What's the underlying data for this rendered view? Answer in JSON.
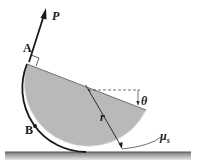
{
  "diagram": {
    "type": "mechanics-free-body",
    "labels": {
      "force": "P",
      "point_a": "A",
      "point_b": "B",
      "radius": "r",
      "angle": "θ",
      "friction": "μ",
      "friction_sub": "s"
    },
    "colors": {
      "body_fill": "#b9b9b9",
      "outline": "#1a1a1a",
      "ground": "#9a9a9a",
      "background": "#ffffff"
    }
  }
}
